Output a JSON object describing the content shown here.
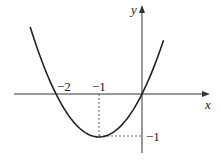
{
  "chart_data": {
    "type": "line",
    "title": "",
    "function": "y = x^2 + 2x",
    "xlabel": "x",
    "ylabel": "y",
    "x": [
      -2.6,
      -2.4,
      -2.2,
      -2,
      -1.8,
      -1.6,
      -1.4,
      -1.2,
      -1,
      -0.8,
      -0.6,
      -0.4,
      -0.2,
      0,
      0.2,
      0.4,
      0.5
    ],
    "series": [
      {
        "name": "parabola",
        "values": [
          1.56,
          0.96,
          0.44,
          0,
          -0.36,
          -0.64,
          -0.84,
          -0.96,
          -1,
          -0.96,
          -0.84,
          -0.64,
          -0.36,
          0,
          0.44,
          0.96,
          1.25
        ]
      }
    ],
    "annotations": [
      {
        "label": "−2",
        "x": -2,
        "y": 0,
        "note": "x-intercept"
      },
      {
        "label": "−1",
        "x": -1,
        "y": 0,
        "note": "vertex x (dashed guide)"
      },
      {
        "label": "−1",
        "x": 0,
        "y": -1,
        "note": "vertex y (dashed guide)"
      }
    ],
    "vertex": [
      -1,
      -1
    ],
    "xlim": [
      -3,
      1.6
    ],
    "ylim": [
      -1.4,
      2.1
    ],
    "grid": false,
    "legend": "none"
  },
  "labels": {
    "x_axis": "x",
    "y_axis": "y",
    "tick_neg2": "−2",
    "tick_neg1_x": "−1",
    "tick_neg1_y": "−1"
  }
}
